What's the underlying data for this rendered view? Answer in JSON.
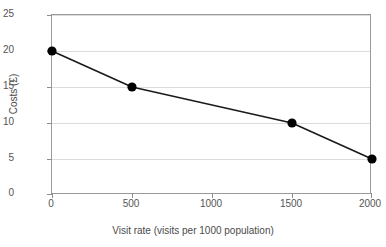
{
  "chart_data": {
    "type": "line",
    "title": "",
    "xlabel": "Visit rate (visits per 1000 population)",
    "ylabel": "Costs (£)",
    "x": [
      0,
      500,
      1500,
      2000
    ],
    "values": [
      20,
      15,
      10,
      5
    ],
    "series": [
      {
        "name": "Costs",
        "x": [
          0,
          500,
          1500,
          2000
        ],
        "values": [
          20,
          15,
          10,
          5
        ]
      }
    ],
    "xlim": [
      0,
      2000
    ],
    "ylim": [
      0,
      25
    ],
    "xticks": [
      0,
      500,
      1000,
      1500,
      2000
    ],
    "yticks": [
      0,
      5,
      10,
      15,
      20,
      25
    ],
    "xtick_labels": [
      "0",
      "500",
      "1000",
      "1500",
      "2000"
    ],
    "ytick_labels": [
      "0",
      "5",
      "10",
      "15",
      "20",
      "25"
    ],
    "grid": "horizontal",
    "legend": "none",
    "marker": "filled-circle",
    "line_color": "#1a1a1a",
    "marker_color": "#000000",
    "grid_color": "#dcdcdc",
    "axis_color": "#9a9a9a",
    "background": "#ffffff"
  }
}
